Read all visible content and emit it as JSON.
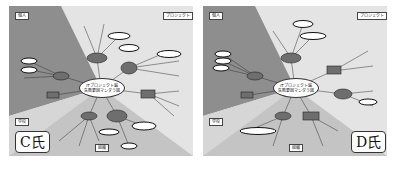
{
  "figure": {
    "panels": [
      {
        "id": "C",
        "person_label": "C氏",
        "center_node": {
          "line1": "ITプロジェクト編",
          "line2": "失敗要因マンダラ図"
        },
        "zones": {
          "top_left": "個人",
          "top_right": "プロジェクト",
          "mid_left": "学校",
          "bottom": "組織"
        }
      },
      {
        "id": "D",
        "person_label": "D氏",
        "center_node": {
          "line1": "ITプロジェクト編",
          "line2": "失敗要因マンダラ図"
        },
        "zones": {
          "top_left": "個人",
          "top_right": "プロジェクト",
          "mid_left": "学校",
          "bottom": "組織"
        }
      }
    ],
    "colors": {
      "zone_individual": "#8e8e8e",
      "zone_project": "#e4e4e4",
      "zone_school": "#d0d0d0",
      "zone_organization": "#c4c4c4",
      "node_fill": "#6e6e6e",
      "highlight_ring": "#111111"
    }
  }
}
